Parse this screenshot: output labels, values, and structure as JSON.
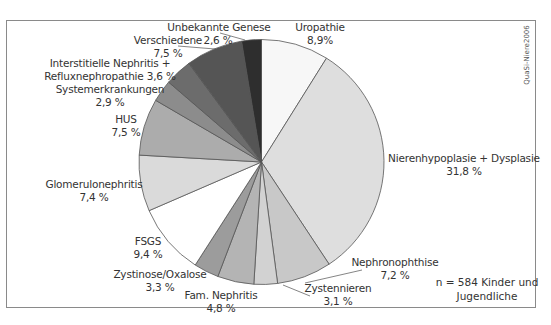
{
  "chart_data": {
    "type": "pie",
    "title": "",
    "start_angle_deg": 0,
    "direction": "clockwise",
    "slices": [
      {
        "label": "Uropathie",
        "value": 8.9,
        "value_text": "8,9%",
        "color": "#f7f7f7"
      },
      {
        "label": "Nierenhypoplasie + Dysplasie",
        "value": 31.8,
        "value_text": "31,8 %",
        "color": "#dedede"
      },
      {
        "label": "Nephronophthise",
        "value": 7.2,
        "value_text": "7,2 %",
        "color": "#c8c8c8"
      },
      {
        "label": "Zystennieren",
        "value": 3.1,
        "value_text": "3,1 %",
        "color": "#d2d2d2"
      },
      {
        "label": "Fam. Nephritis",
        "value": 4.8,
        "value_text": "4,8 %",
        "color": "#b4b4b4"
      },
      {
        "label": "Zystinose/Oxalose",
        "value": 3.3,
        "value_text": "3,3 %",
        "color": "#9c9c9c"
      },
      {
        "label": "FSGS",
        "value": 9.4,
        "value_text": "9,4 %",
        "color": "#ffffff"
      },
      {
        "label": "Glomerulonephritis",
        "value": 7.4,
        "value_text": "7,4 %",
        "color": "#dadada"
      },
      {
        "label": "HUS",
        "value": 7.5,
        "value_text": "7,5 %",
        "color": "#acacac"
      },
      {
        "label": "Systemerkrankungen",
        "value": 2.9,
        "value_text": "2,9 %",
        "color": "#8c8c8c"
      },
      {
        "label": "Interstitielle Nephritis + Refluxnephropathie",
        "value": 3.6,
        "value_text": "3,6 %",
        "color": "#6c6c6c"
      },
      {
        "label": "Verschiedene",
        "value": 7.5,
        "value_text": "7,5 %",
        "color": "#555555"
      },
      {
        "label": "Unbekannte Genese",
        "value": 2.6,
        "value_text": "2,6 %",
        "color": "#2e2e2e"
      }
    ],
    "annotation": "n = 584 Kinder und Jugendliche",
    "source_watermark": "QuaSi-Niere2006"
  },
  "labels": {
    "uropathie": {
      "name": "Uropathie",
      "value": "8,9%"
    },
    "nierenhypoplasie": {
      "name": "Nierenhypoplasie + Dysplasie",
      "value": "31,8 %"
    },
    "nephronophthise": {
      "name": "Nephronophthise",
      "value": "7,2 %"
    },
    "zystennieren": {
      "name": "Zystennieren",
      "value": "3,1 %"
    },
    "fam_nephritis": {
      "name": "Fam. Nephritis",
      "value": "4,8 %"
    },
    "zystinose": {
      "name": "Zystinose/Oxalose",
      "value": "3,3 %"
    },
    "fsgs": {
      "name": "FSGS",
      "value": "9,4 %"
    },
    "glomerulonephritis": {
      "name": "Glomerulonephritis",
      "value": "7,4 %"
    },
    "hus": {
      "name": "HUS",
      "value": "7,5 %"
    },
    "systemerkrankungen": {
      "name": "Systemerkrankungen",
      "value": "2,9 %"
    },
    "interstitielle": {
      "line1": "Interstitielle Nephritis +",
      "line2": "Refluxnephropathie 3,6 %"
    },
    "verschiedene": {
      "name": "Verschiedene",
      "value": "7,5 %"
    },
    "unbekannte": {
      "name": "Unbekannte Genese",
      "value": "2,6 %"
    }
  },
  "note": {
    "line1": "n = 584 Kinder und",
    "line2": "Jugendliche"
  },
  "watermark": "QuaSi-Niere2006"
}
